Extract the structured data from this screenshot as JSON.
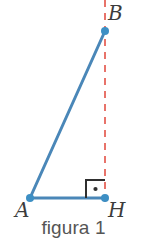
{
  "figure": {
    "caption": "figura 1",
    "type": "right-triangle-with-altitude",
    "background_color": "#ffffff",
    "canvas": {
      "width": 147,
      "height": 251
    },
    "colors": {
      "segment_blue": "#4a87b8",
      "vertex_blue": "#3d8fc4",
      "dashed_red": "#e8736a",
      "label_gray": "#3c3c3c",
      "caption_gray": "#555555",
      "angle_mark_dark": "#2f2f2f"
    },
    "vertices": [
      {
        "name": "B",
        "label": "B",
        "x": 105,
        "y": 31,
        "label_x": 108,
        "label_y": 3
      },
      {
        "name": "A",
        "label": "A",
        "x": 30,
        "y": 198,
        "label_x": 15,
        "label_y": 200
      },
      {
        "name": "H",
        "label": "H",
        "x": 105,
        "y": 198,
        "label_x": 108,
        "label_y": 200
      }
    ],
    "segments": [
      {
        "name": "segment-AB",
        "from": "A",
        "to": "B",
        "style": "solid",
        "color": "#4a87b8",
        "width": 3
      },
      {
        "name": "segment-AH",
        "from": "A",
        "to": "H",
        "style": "solid",
        "color": "#4a87b8",
        "width": 3
      }
    ],
    "dashed_line": {
      "name": "vertical-dashed-line",
      "x": 105,
      "y_start": 0,
      "y_end": 206,
      "color": "#e8736a",
      "width": 2,
      "dash": "7 6"
    },
    "right_angle_mark": {
      "name": "right-angle-mark-at-H",
      "at_vertex": "H",
      "x": 86,
      "y": 180,
      "size": 19,
      "color": "#2f2f2f",
      "has_center_dot": true,
      "dot_x": 95,
      "dot_y": 189
    }
  }
}
